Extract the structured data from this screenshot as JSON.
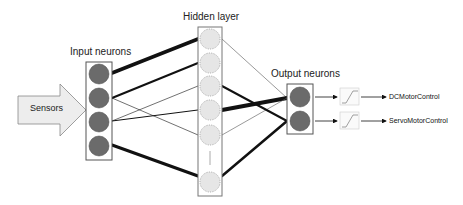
{
  "labels": {
    "sensors": "Sensors",
    "input": "Input neurons",
    "hidden": "Hidden layer",
    "output": "Output neurons",
    "out1": "DCMotorControl",
    "out2": "ServoMotorControl"
  },
  "colors": {
    "neuron_fill": "#6b6b6b",
    "hidden_fill": "#e6e6e6",
    "arrow_fill": "#ededed",
    "line": "#111111"
  },
  "layers": {
    "input_count": 4,
    "hidden_count_shown": 6,
    "output_count": 2
  }
}
